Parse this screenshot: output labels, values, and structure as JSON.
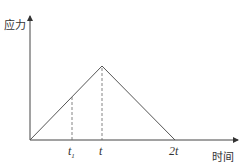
{
  "diagram": {
    "type": "stress-time triangular loading",
    "y_axis_label": "应力",
    "x_axis_label": "时间",
    "ticks": [
      {
        "id": "t1",
        "base": "t",
        "sub": "1"
      },
      {
        "id": "t",
        "base": "t",
        "sub": ""
      },
      {
        "id": "2t",
        "base": "2t",
        "sub": ""
      }
    ],
    "curve_points": [
      {
        "time": "0",
        "stress": 0
      },
      {
        "time": "t",
        "stress": "peak"
      },
      {
        "time": "2t",
        "stress": 0
      }
    ],
    "dashed_guides": [
      "t1",
      "t"
    ],
    "colors": {
      "line": "#555555",
      "axis": "#444444",
      "text": "#333333"
    }
  }
}
